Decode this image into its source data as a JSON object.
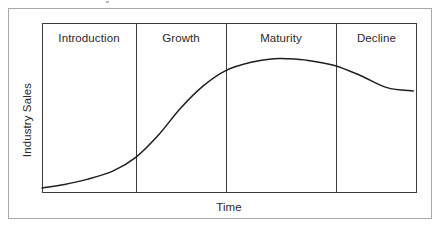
{
  "figure": {
    "background_color": "#ffffff",
    "outer_frame_color": "#a9a9a9",
    "plot_border_color": "#3c3c3c",
    "curve_color": "#1f1f1f"
  },
  "axes": {
    "y_label": "Industry Sales",
    "x_label": "Time"
  },
  "stages": [
    {
      "label": "Introduction",
      "center_x": 89
    },
    {
      "label": "Growth",
      "center_x": 181
    },
    {
      "label": "Maturity",
      "center_x": 281
    },
    {
      "label": "Decline",
      "center_x": 377
    }
  ],
  "chart_data": {
    "type": "line",
    "xlabel": "Time",
    "ylabel": "Industry Sales",
    "grid": false,
    "legend": null,
    "axis_tick_labels": {
      "x": [],
      "y": []
    },
    "xlim": [
      0,
      100
    ],
    "ylim": [
      0,
      100
    ],
    "annotations": [
      "Introduction",
      "Growth",
      "Maturity",
      "Decline"
    ],
    "stage_boundaries_x": [
      25,
      49,
      78
    ],
    "series": [
      {
        "name": "Industry Sales",
        "x": [
          0,
          6,
          12,
          19,
          25,
          31,
          37,
          43,
          49,
          56,
          62,
          65,
          71,
          78,
          85,
          92,
          99
        ],
        "values": [
          3,
          5,
          8,
          13,
          21,
          34,
          50,
          63,
          72,
          77,
          79,
          79,
          78,
          75,
          69,
          62,
          60
        ]
      }
    ]
  }
}
